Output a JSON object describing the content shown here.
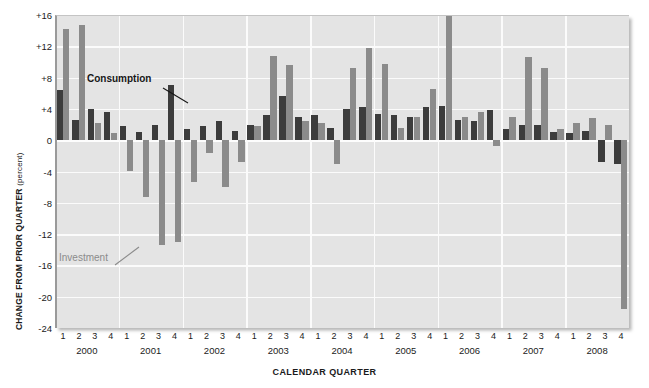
{
  "chart_data": {
    "type": "bar",
    "title": "",
    "subtitle": "",
    "xlabel": "CALENDAR QUARTER",
    "ylabel": "CHANGE FROM PRIOR QUARTER",
    "ylabel_unit": "(percent)",
    "ylim": [
      -24,
      16
    ],
    "yticks": [
      16,
      12,
      8,
      4,
      0,
      -4,
      -8,
      -12,
      -16,
      -20,
      -24
    ],
    "ytick_labels": [
      "+16",
      "+12",
      "+8",
      "+4",
      "0",
      "-4",
      "-8",
      "-12",
      "-16",
      "-20",
      "-24"
    ],
    "grid": true,
    "grid_axis": "both",
    "legend_position": "in-plot-annotations",
    "years": [
      "2000",
      "2001",
      "2002",
      "2003",
      "2004",
      "2005",
      "2006",
      "2007",
      "2008"
    ],
    "quarters": [
      "1",
      "2",
      "3",
      "4"
    ],
    "categories": [
      "2000 Q1",
      "2000 Q2",
      "2000 Q3",
      "2000 Q4",
      "2001 Q1",
      "2001 Q2",
      "2001 Q3",
      "2001 Q4",
      "2002 Q1",
      "2002 Q2",
      "2002 Q3",
      "2002 Q4",
      "2003 Q1",
      "2003 Q2",
      "2003 Q3",
      "2003 Q4",
      "2004 Q1",
      "2004 Q2",
      "2004 Q3",
      "2004 Q4",
      "2005 Q1",
      "2005 Q2",
      "2005 Q3",
      "2005 Q4",
      "2006 Q1",
      "2006 Q2",
      "2006 Q3",
      "2006 Q4",
      "2007 Q1",
      "2007 Q2",
      "2007 Q3",
      "2007 Q4",
      "2008 Q1",
      "2008 Q2",
      "2008 Q3",
      "2008 Q4"
    ],
    "series": [
      {
        "name": "Consumption",
        "color": "#3c3c3c",
        "values": [
          6.4,
          2.6,
          4.0,
          3.6,
          1.8,
          1.0,
          1.9,
          7.0,
          1.4,
          1.8,
          2.4,
          1.2,
          2.0,
          3.2,
          5.6,
          3.0,
          3.2,
          1.6,
          4.0,
          4.2,
          3.4,
          3.2,
          3.0,
          4.2,
          4.4,
          2.6,
          2.4,
          3.8,
          1.4,
          2.0,
          2.0,
          1.0,
          0.9,
          1.2,
          -2.8,
          -3.1
        ]
      },
      {
        "name": "Investment",
        "color": "#8b8b8b",
        "values": [
          14.2,
          14.7,
          2.2,
          0.9,
          -4.0,
          -7.2,
          -13.4,
          -13.0,
          -5.4,
          -1.6,
          -6.0,
          -2.8,
          1.8,
          10.8,
          9.6,
          2.4,
          2.2,
          -3.0,
          9.2,
          11.8,
          9.8,
          1.6,
          3.0,
          6.6,
          16.0,
          3.0,
          3.6,
          -0.7,
          3.0,
          10.6,
          9.2,
          1.4,
          2.2,
          2.8,
          2.0,
          -21.6
        ]
      }
    ],
    "annotations": [
      {
        "text": "Consumption",
        "series": "Consumption",
        "points_to": "2001 Q4"
      },
      {
        "text": "Investment",
        "series": "Investment",
        "points_to": "2001 Q3"
      }
    ]
  }
}
